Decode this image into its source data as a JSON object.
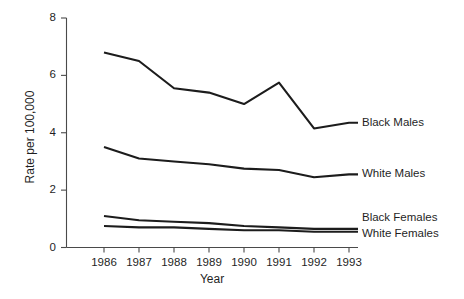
{
  "chart_data": {
    "type": "line",
    "title": "",
    "xlabel": "Year",
    "ylabel": "Rate per 100,000",
    "categories": [
      "1986",
      "1987",
      "1988",
      "1989",
      "1990",
      "1991",
      "1992",
      "1993"
    ],
    "x": [
      1986,
      1987,
      1988,
      1989,
      1990,
      1991,
      1992,
      1993
    ],
    "xlim": [
      1986,
      1993
    ],
    "ylim": [
      0,
      8
    ],
    "yticks": [
      0,
      2,
      4,
      6,
      8
    ],
    "ytick_labels": [
      "0",
      "2",
      "4",
      "6",
      "8"
    ],
    "xtick_labels": [
      "1986",
      "1987",
      "1988",
      "1989",
      "1990",
      "1991",
      "1992",
      "1993"
    ],
    "grid": false,
    "legend_position": "right-inline-labels",
    "line_color": "#1c1c1c",
    "axis_color": "#4a4a4a",
    "series": [
      {
        "name": "Black Males",
        "values": [
          6.8,
          6.5,
          5.55,
          5.4,
          5.0,
          5.75,
          4.15,
          4.35
        ]
      },
      {
        "name": "White Males",
        "values": [
          3.5,
          3.1,
          3.0,
          2.9,
          2.75,
          2.7,
          2.45,
          2.55
        ]
      },
      {
        "name": "Black Females",
        "values": [
          1.1,
          0.95,
          0.9,
          0.85,
          0.75,
          0.7,
          0.65,
          0.65
        ]
      },
      {
        "name": "White Females",
        "values": [
          0.75,
          0.7,
          0.7,
          0.65,
          0.6,
          0.6,
          0.55,
          0.55
        ]
      }
    ]
  }
}
